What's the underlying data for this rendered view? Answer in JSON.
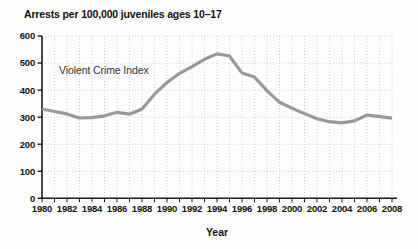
{
  "title": "Arrests per 100,000 juveniles ages 10–17",
  "annotation_label": "Violent Crime Index",
  "x_axis_label": "Year",
  "colors": {
    "line": "#999999",
    "axis": "#1a1a1a",
    "grid": "#d0d0d0",
    "text": "#111111",
    "annotation_text": "#333333",
    "background": "#fdfdfb"
  },
  "chart_data": {
    "type": "line",
    "title": "Arrests per 100,000 juveniles ages 10–17",
    "xlabel": "Year",
    "ylabel": "Arrests per 100,000 juveniles ages 10–17",
    "ylim": [
      0,
      600
    ],
    "xlim": [
      1980,
      2008
    ],
    "y_ticks": [
      0,
      100,
      200,
      300,
      400,
      500,
      600
    ],
    "x_major_tick_labels": [
      1980,
      1982,
      1984,
      1986,
      1988,
      1990,
      1992,
      1994,
      1996,
      1998,
      2000,
      2002,
      2004,
      2006,
      2008
    ],
    "x_minor_tick_interval": 1,
    "grid": "dotted gridlines, vertical every year and horizontal every 100",
    "legend_position": "text label inside plot, upper left",
    "x": [
      1980,
      1981,
      1982,
      1983,
      1984,
      1985,
      1986,
      1987,
      1988,
      1989,
      1990,
      1991,
      1992,
      1993,
      1994,
      1995,
      1996,
      1997,
      1998,
      1999,
      2000,
      2001,
      2002,
      2003,
      2004,
      2005,
      2006,
      2007,
      2008
    ],
    "series": [
      {
        "name": "Violent Crime Index",
        "values": [
          330,
          321,
          312,
          297,
          298,
          305,
          318,
          311,
          330,
          385,
          428,
          462,
          487,
          514,
          534,
          526,
          463,
          448,
          398,
          355,
          333,
          313,
          294,
          283,
          279,
          286,
          308,
          302,
          296
        ]
      }
    ]
  }
}
